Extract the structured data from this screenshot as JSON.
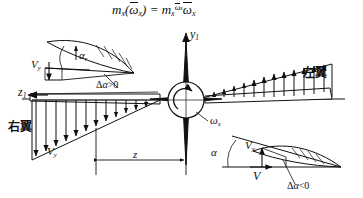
{
  "figure": {
    "title_formula": {
      "lhs_m": "m",
      "lhs_sub": "x",
      "lhs_arg_open": "(",
      "lhs_omega": "ω",
      "lhs_omega_sub": "x",
      "lhs_arg_close": ")",
      "equals": "=",
      "rhs_m": "m",
      "rhs_sub": "x",
      "rhs_sup_omega": "ω",
      "rhs_sup_omega_sub": "x",
      "rhs_omega": "ω",
      "rhs_omega_sub": "x",
      "plain": "m x ( ω x ) = m x ^ ω x · ω x"
    },
    "axes": {
      "vertical_label": "y",
      "vertical_sub": "1",
      "horizontal_label": "z",
      "horizontal_sub": "1",
      "roll_rate_label": "ω",
      "roll_rate_sub": "x"
    },
    "wings": {
      "right_wing_label": "右翼",
      "left_wing_label": "左翼"
    },
    "dimension": {
      "span_label": "z"
    },
    "inset_top_left": {
      "alpha": "α",
      "alpha_sub": "r",
      "velocity": "V",
      "velocity_sub": "y",
      "delta_alpha": "Δ",
      "delta_alpha_symbol": "α",
      "delta_alpha_rel": ">0"
    },
    "inset_bottom_right": {
      "alpha": "α",
      "velocity_y": "V",
      "velocity_y_sub": "y",
      "velocity": "V",
      "delta_alpha": "Δ",
      "delta_alpha_symbol": "α",
      "delta_alpha_rel": "<0"
    },
    "lower_left_velocity": {
      "velocity": "V",
      "velocity_sub": "y"
    },
    "colors": {
      "ink": "#111111",
      "background": "#ffffff"
    }
  }
}
